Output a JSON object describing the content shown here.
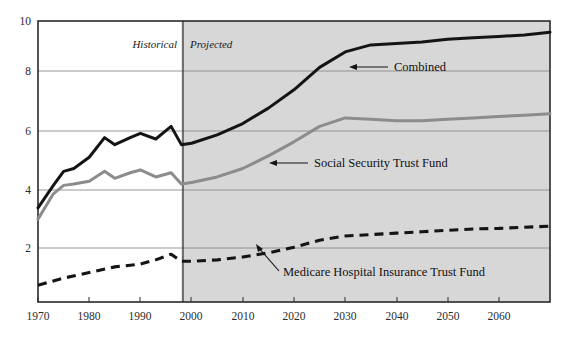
{
  "chart_data": {
    "type": "line",
    "title": "",
    "subtitle": "",
    "xlabel": "",
    "ylabel": "",
    "xlim": [
      1970,
      2070
    ],
    "ylim": [
      0,
      10
    ],
    "grid": true,
    "legend_position": "inline-annotations",
    "x_ticks": [
      "1970",
      "1980",
      "1990",
      "2000",
      "2010",
      "2020",
      "2030",
      "2040",
      "2050",
      "2060"
    ],
    "y_ticks": [
      "2",
      "4",
      "6",
      "8",
      "10"
    ],
    "regions": [
      {
        "name": "historical",
        "label": "Historical",
        "x_start": 1970,
        "x_end": 1998,
        "shaded": false
      },
      {
        "name": "projected",
        "label": "Projected",
        "x_start": 1998,
        "x_end": 2070,
        "shaded": true
      }
    ],
    "divider_year": 1998,
    "colors": {
      "combined": "#141414",
      "social_security": "#8c8c8c",
      "medicare": "#141414",
      "projected_shading": "#d7d7d7",
      "gridline": "#8a8a8a",
      "axis": "#2a2a2a",
      "plot_background": "#ffffff"
    },
    "series": [
      {
        "name": "Combined",
        "style": "solid",
        "color": "#141414",
        "label_text": "Combined",
        "x": [
          1970,
          1973,
          1975,
          1977,
          1980,
          1983,
          1985,
          1988,
          1990,
          1993,
          1996,
          1998,
          2000,
          2005,
          2010,
          2015,
          2020,
          2025,
          2030,
          2035,
          2040,
          2045,
          2050,
          2055,
          2060,
          2065,
          2070
        ],
        "values": [
          3.35,
          4.15,
          4.65,
          4.75,
          5.15,
          5.85,
          5.6,
          5.85,
          6.0,
          5.8,
          6.25,
          5.6,
          5.65,
          5.95,
          6.35,
          6.9,
          7.55,
          8.35,
          8.9,
          9.15,
          9.2,
          9.25,
          9.35,
          9.4,
          9.45,
          9.5,
          9.6
        ]
      },
      {
        "name": "Social Security Trust Fund",
        "style": "solid",
        "color": "#8c8c8c",
        "label_text": "Social Security Trust Fund",
        "x": [
          1970,
          1973,
          1975,
          1977,
          1980,
          1983,
          1985,
          1988,
          1990,
          1993,
          1996,
          1998,
          2000,
          2005,
          2010,
          2015,
          2020,
          2025,
          2030,
          2035,
          2040,
          2045,
          2050,
          2055,
          2060,
          2065,
          2070
        ],
        "values": [
          2.95,
          3.85,
          4.15,
          4.2,
          4.3,
          4.65,
          4.4,
          4.6,
          4.7,
          4.45,
          4.6,
          4.2,
          4.25,
          4.45,
          4.75,
          5.2,
          5.7,
          6.25,
          6.55,
          6.5,
          6.45,
          6.45,
          6.5,
          6.55,
          6.6,
          6.65,
          6.7
        ]
      },
      {
        "name": "Medicare Hospital Insurance Trust Fund",
        "style": "dashed",
        "color": "#141414",
        "label_text": "Medicare Hospital Insurance Trust Fund",
        "x": [
          1970,
          1975,
          1980,
          1985,
          1990,
          1993,
          1996,
          1998,
          2000,
          2005,
          2010,
          2015,
          2020,
          2025,
          2030,
          2035,
          2040,
          2045,
          2050,
          2055,
          2060,
          2065,
          2070
        ],
        "values": [
          0.6,
          0.85,
          1.05,
          1.25,
          1.35,
          1.5,
          1.7,
          1.45,
          1.45,
          1.5,
          1.6,
          1.75,
          1.95,
          2.2,
          2.35,
          2.4,
          2.45,
          2.5,
          2.55,
          2.6,
          2.62,
          2.66,
          2.7
        ]
      }
    ],
    "annotations": [
      {
        "name": "combined-annotation",
        "text": "Combined",
        "arrow": true
      },
      {
        "name": "social-security-annotation",
        "text": "Social Security Trust Fund",
        "arrow": true
      },
      {
        "name": "medicare-annotation",
        "text": "Medicare Hospital Insurance Trust Fund",
        "arrow": true
      }
    ]
  }
}
